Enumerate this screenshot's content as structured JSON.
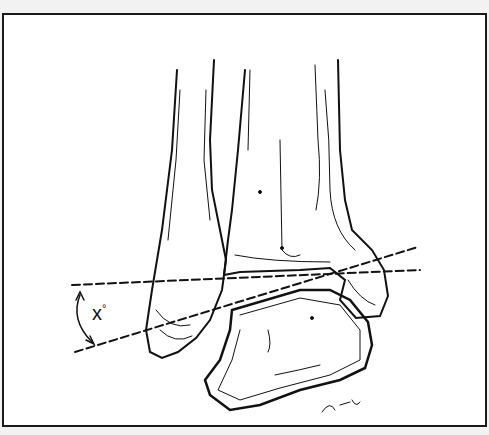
{
  "figure": {
    "angle_label": "x",
    "angle_unit": "°",
    "signature": "L.V.S.",
    "ink_color": "#111111",
    "background": "#ffffff",
    "frame_color": "#1a1a1a"
  }
}
